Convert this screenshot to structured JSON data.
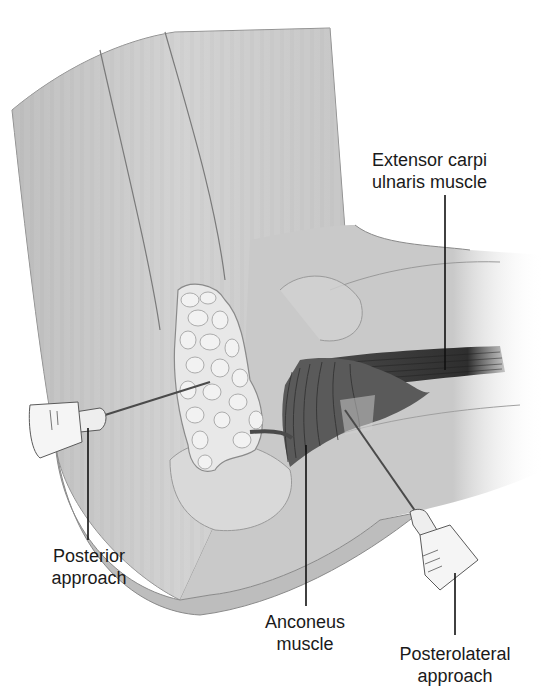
{
  "figure": {
    "style": "grayscale medical illustration",
    "colors": {
      "background": "#ffffff",
      "skin_fill": "#cfcfcf",
      "skin_shadow": "#a9a9a9",
      "skin_outline": "#8a8a8a",
      "fat_pad_fill": "#e6e6e6",
      "muscle_dark": "#3a3a3a",
      "needle": "#4a4a4a",
      "syringe_fill": "#eeeeee",
      "leader_line": "#111111",
      "label_text": "#1a1a1a"
    }
  },
  "labels": {
    "extensor_carpi_ulnaris": {
      "line1": "Extensor carpi",
      "line2": "ulnaris muscle"
    },
    "posterior_approach": {
      "line1": "Posterior",
      "line2": "approach"
    },
    "anconeus_muscle": {
      "line1": "Anconeus",
      "line2": "muscle"
    },
    "posterolateral_approach": {
      "line1": "Posterolateral",
      "line2": "approach"
    }
  }
}
